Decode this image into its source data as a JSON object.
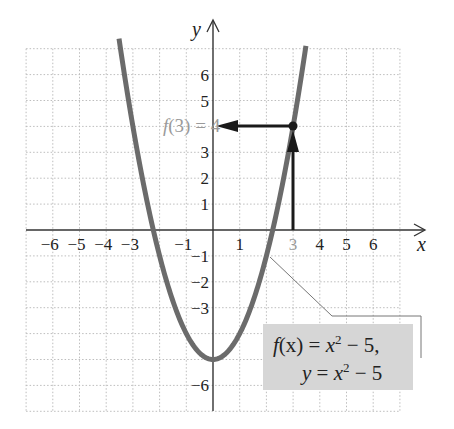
{
  "chart_data": {
    "type": "line",
    "title": "",
    "function": "x^2 - 5",
    "xlabel": "x",
    "ylabel": "y",
    "xlim": [
      -7,
      7
    ],
    "ylim": [
      -7,
      7
    ],
    "grid": true,
    "x_ticks": [
      -6,
      -5,
      -4,
      -3,
      -1,
      1,
      3,
      4,
      5,
      6
    ],
    "x_tick_labels": [
      "−6",
      "−5",
      "−4",
      "−3",
      "−1",
      "1",
      "3",
      "4",
      "5",
      "6"
    ],
    "y_ticks": [
      6,
      5,
      4,
      3,
      2,
      1,
      -1,
      -2,
      -3,
      -6
    ],
    "y_tick_labels": [
      "6",
      "5",
      "4",
      "3",
      "2",
      "1",
      "−1",
      "−2",
      "−3",
      "−6"
    ],
    "series": [
      {
        "name": "f(x) = x^2 - 5",
        "color": "#6b6b6b",
        "x": [
          -3.5,
          -3,
          -2,
          -1,
          0,
          1,
          2,
          3,
          3.5
        ],
        "y": [
          7.25,
          4,
          -1,
          -4,
          -5,
          -4,
          -1,
          4,
          7.25
        ]
      }
    ],
    "highlight_point": {
      "x": 3,
      "y": 4,
      "label": "f(3) = 4"
    },
    "annotations": [
      {
        "text": "f(3) = 4",
        "at": [
          0,
          4
        ],
        "color": "#9a9a9a"
      },
      {
        "text": "f(x) = x² − 5, y = x² − 5",
        "box_color": "#d6d6d6"
      }
    ]
  },
  "labels": {
    "x_axis": "x",
    "y_axis": "y",
    "f3_left": "f",
    "f3_paren": "(3) = 4",
    "box_line1_f": "f",
    "box_line1_x": "(x)",
    "box_line1_eq": " = ",
    "box_line1_x2": "x",
    "box_line1_sup": "2",
    "box_line1_rest": " − 5,",
    "box_line2_y": "y",
    "box_line2_eq": " = ",
    "box_line2_x": "x",
    "box_line2_sup": "2",
    "box_line2_rest": " − 5"
  },
  "colors": {
    "curve": "#6b6b6b",
    "arrows": "#1a1a1a",
    "grid": "#bdbdbd",
    "label_box": "#d6d6d6",
    "highlight_text": "#9a9a9a"
  }
}
